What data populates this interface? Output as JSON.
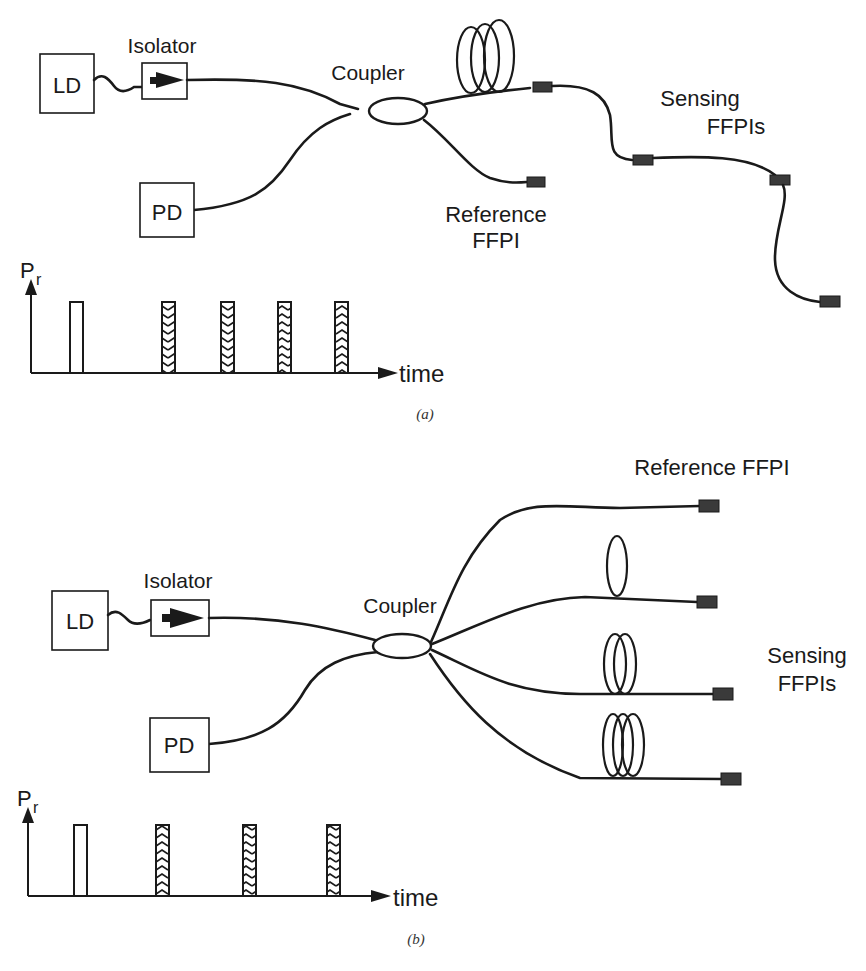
{
  "figure_a": {
    "caption": "(a)",
    "source_label": "LD",
    "isolator_label": "Isolator",
    "coupler_label": "Coupler",
    "detector_label": "PD",
    "reference_label_line1": "Reference",
    "reference_label_line2": "FFPI",
    "sensing_label_line1": "Sensing",
    "sensing_label_line2": "FFPIs",
    "topology": "series",
    "sensing_ffpi_count": 3,
    "plot": {
      "y_label": "P",
      "y_label_sub": "r",
      "x_label": "time",
      "pulses": [
        "reference",
        "sensing",
        "sensing",
        "sensing",
        "sensing"
      ]
    }
  },
  "figure_b": {
    "caption": "(b)",
    "source_label": "LD",
    "isolator_label": "Isolator",
    "coupler_label": "Coupler",
    "detector_label": "PD",
    "reference_label": "Reference FFPI",
    "sensing_label_line1": "Sensing",
    "sensing_label_line2": "FFPIs",
    "topology": "parallel",
    "sensing_ffpi_count": 3,
    "plot": {
      "y_label": "P",
      "y_label_sub": "r",
      "x_label": "time",
      "pulses": [
        "reference",
        "sensing",
        "sensing",
        "sensing"
      ]
    }
  }
}
